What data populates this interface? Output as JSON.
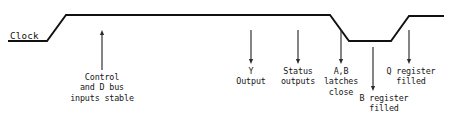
{
  "diagram": {
    "signal_label": "Clock",
    "stroke_color": "#111111",
    "arrow_color": "#2b2b2b",
    "background_color": "#ffffff",
    "waveform": {
      "type": "digital-clock-waveform",
      "high_level_y": 15,
      "low_level_y": 41,
      "points": [
        {
          "x": 8,
          "y": 41
        },
        {
          "x": 47,
          "y": 41
        },
        {
          "x": 66,
          "y": 15
        },
        {
          "x": 330,
          "y": 15
        },
        {
          "x": 349,
          "y": 41
        },
        {
          "x": 391,
          "y": 41
        },
        {
          "x": 409,
          "y": 16
        },
        {
          "x": 444,
          "y": 16
        }
      ]
    },
    "clock_underline": {
      "x1": 8,
      "x2": 47,
      "y": 41
    }
  },
  "annotations": [
    {
      "id": "control-and-d-bus",
      "name": "control-d-bus-inputs-stable",
      "lines": [
        "Control",
        "and D bus",
        "inputs stable"
      ],
      "arrow": {
        "x": 102,
        "y_start": 70,
        "y_end": 30,
        "direction": "up"
      },
      "text_x": 102,
      "text_y": 72
    },
    {
      "id": "y-output",
      "name": "y-output",
      "lines": [
        "Y",
        "Output"
      ],
      "arrow": {
        "x": 251,
        "y_start": 30,
        "y_end": 64,
        "direction": "down"
      },
      "text_x": 251,
      "text_y": 66
    },
    {
      "id": "status-outputs",
      "name": "status-outputs",
      "lines": [
        "Status",
        "outputs"
      ],
      "arrow": {
        "x": 298,
        "y_start": 30,
        "y_end": 64,
        "direction": "down"
      },
      "text_x": 298,
      "text_y": 66
    },
    {
      "id": "ab-latches-close",
      "name": "ab-latches-close",
      "lines": [
        "A,B",
        "latches",
        "close"
      ],
      "arrow": {
        "x": 341,
        "y_start": 30,
        "y_end": 64,
        "direction": "down"
      },
      "text_x": 341,
      "text_y": 66
    },
    {
      "id": "b-register-filled",
      "name": "b-register-filled",
      "lines": [
        "B register",
        "filled"
      ],
      "arrow": {
        "x": 373,
        "y_start": 47,
        "y_end": 91,
        "direction": "down"
      },
      "text_x": 384,
      "text_y": 93
    },
    {
      "id": "q-register-filled",
      "name": "q-register-filled",
      "lines": [
        "Q register",
        "filled"
      ],
      "arrow": {
        "x": 409,
        "y_start": 30,
        "y_end": 64,
        "direction": "down"
      },
      "text_x": 411,
      "text_y": 66
    }
  ],
  "clock_label_position": {
    "x": 10,
    "y": 31
  }
}
